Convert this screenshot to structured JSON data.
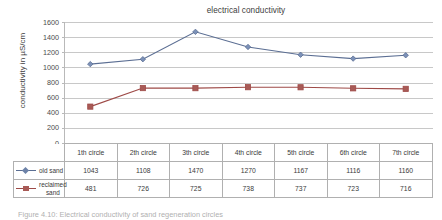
{
  "chart_data": {
    "type": "line",
    "title": "electrical conductivity",
    "xlabel": "",
    "ylabel": "conductivity in µS/cm",
    "categories": [
      "1th circle",
      "2th circle",
      "3th circle",
      "4th circle",
      "5th circle",
      "6th circle",
      "7th circle"
    ],
    "series": [
      {
        "name": "old sand",
        "color": "#5b6e93",
        "marker": "diamond",
        "values": [
          1043,
          1108,
          1470,
          1270,
          1167,
          1116,
          1160
        ]
      },
      {
        "name": "reclaimed sand",
        "color": "#9e4a47",
        "marker": "square",
        "values": [
          481,
          726,
          725,
          738,
          737,
          723,
          716
        ]
      }
    ],
    "ylim": [
      0,
      1600
    ],
    "ytick_step": 200,
    "yticks": [
      "1600",
      "1400",
      "1200",
      "1000",
      "800",
      "600",
      "400",
      "200",
      "0"
    ],
    "grid": true,
    "legend_position": "table-left",
    "data_table_shown": true
  },
  "caption": {
    "text": "Figure 4.10: Electrical conductivity of sand regeneration circles"
  },
  "colors": {
    "series_old_sand": "#5b6e93",
    "series_reclaimed_sand": "#9e4a47",
    "gridline": "#c8c8c8",
    "table_border": "#b0b0b0",
    "background": "#ffffff"
  }
}
